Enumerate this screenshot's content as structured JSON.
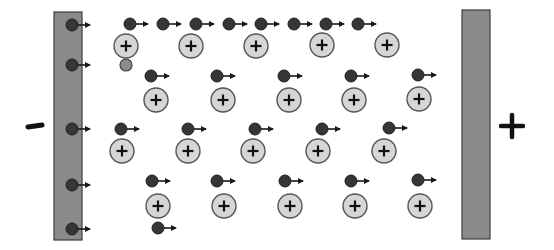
{
  "diagram": {
    "colors": {
      "plate_fill": "#8a8a8a",
      "plate_stroke": "#3c3c3c",
      "electron_fill": "#363636",
      "electron_stroke": "#1e1e1e",
      "ion_fill": "#d6d6d6",
      "ion_stroke": "#555555",
      "neutral_fill": "#8c8c8c",
      "arrow": "#1a1a1a",
      "sign": "#111111"
    },
    "negative_terminal": {
      "label": "−",
      "x": 35,
      "y": 126
    },
    "positive_terminal": {
      "label": "+",
      "x": 512,
      "y": 126
    },
    "left_plate": {
      "x": 54,
      "y": 12,
      "w": 28,
      "h": 228
    },
    "right_plate": {
      "x": 462,
      "y": 10,
      "w": 28,
      "h": 229
    },
    "plate_electrons": [
      {
        "x": 72,
        "y": 25
      },
      {
        "x": 72,
        "y": 65
      },
      {
        "x": 72,
        "y": 129
      },
      {
        "x": 72,
        "y": 185
      },
      {
        "x": 72,
        "y": 229
      }
    ],
    "electrons": [
      {
        "x": 130,
        "y": 24
      },
      {
        "x": 163,
        "y": 24
      },
      {
        "x": 196,
        "y": 24
      },
      {
        "x": 229,
        "y": 24
      },
      {
        "x": 261,
        "y": 24
      },
      {
        "x": 294,
        "y": 24
      },
      {
        "x": 326,
        "y": 24
      },
      {
        "x": 358,
        "y": 24
      },
      {
        "x": 151,
        "y": 76
      },
      {
        "x": 217,
        "y": 76
      },
      {
        "x": 284,
        "y": 76
      },
      {
        "x": 351,
        "y": 76
      },
      {
        "x": 418,
        "y": 75
      },
      {
        "x": 121,
        "y": 129
      },
      {
        "x": 188,
        "y": 129
      },
      {
        "x": 255,
        "y": 129
      },
      {
        "x": 322,
        "y": 129
      },
      {
        "x": 389,
        "y": 128
      },
      {
        "x": 152,
        "y": 181
      },
      {
        "x": 217,
        "y": 181
      },
      {
        "x": 285,
        "y": 181
      },
      {
        "x": 351,
        "y": 181
      },
      {
        "x": 418,
        "y": 180
      },
      {
        "x": 158,
        "y": 228
      }
    ],
    "ions": [
      {
        "x": 126,
        "y": 46,
        "label": "+"
      },
      {
        "x": 191,
        "y": 46,
        "label": "+"
      },
      {
        "x": 256,
        "y": 46,
        "label": "+"
      },
      {
        "x": 322,
        "y": 45,
        "label": "+"
      },
      {
        "x": 387,
        "y": 45,
        "label": "+"
      },
      {
        "x": 156,
        "y": 100,
        "label": "+"
      },
      {
        "x": 223,
        "y": 100,
        "label": "+"
      },
      {
        "x": 289,
        "y": 100,
        "label": "+"
      },
      {
        "x": 354,
        "y": 100,
        "label": "+"
      },
      {
        "x": 419,
        "y": 99,
        "label": "+"
      },
      {
        "x": 122,
        "y": 151,
        "label": "+"
      },
      {
        "x": 188,
        "y": 151,
        "label": "+"
      },
      {
        "x": 253,
        "y": 151,
        "label": "+"
      },
      {
        "x": 318,
        "y": 151,
        "label": "+"
      },
      {
        "x": 384,
        "y": 151,
        "label": "+"
      },
      {
        "x": 158,
        "y": 206,
        "label": "+"
      },
      {
        "x": 224,
        "y": 206,
        "label": "+"
      },
      {
        "x": 290,
        "y": 206,
        "label": "+"
      },
      {
        "x": 355,
        "y": 206,
        "label": "+"
      },
      {
        "x": 420,
        "y": 206,
        "label": "+"
      }
    ],
    "neutral_particles": [
      {
        "x": 126,
        "y": 65
      }
    ]
  }
}
